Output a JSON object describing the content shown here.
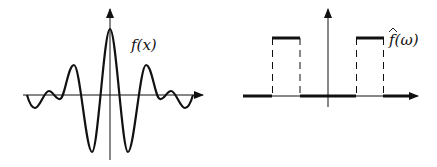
{
  "diagram": {
    "left_panel": {
      "label": "f(x)",
      "description": "sinc-like oscillating function in spatial domain"
    },
    "right_panel": {
      "label": "f(ω)",
      "hat": "^",
      "description": "Fourier transform: two rectangular bands symmetric about origin"
    }
  },
  "colors": {
    "stroke": "#111111",
    "background": "#ffffff"
  }
}
